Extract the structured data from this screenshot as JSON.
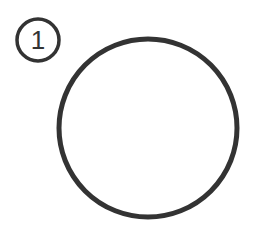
{
  "marker": {
    "label": "1",
    "cx": 38,
    "cy": 40,
    "r": 21
  },
  "shape": {
    "type": "circle",
    "cx": 148,
    "cy": 128,
    "r": 89
  },
  "colors": {
    "stroke": "#333333",
    "background": "#ffffff"
  }
}
